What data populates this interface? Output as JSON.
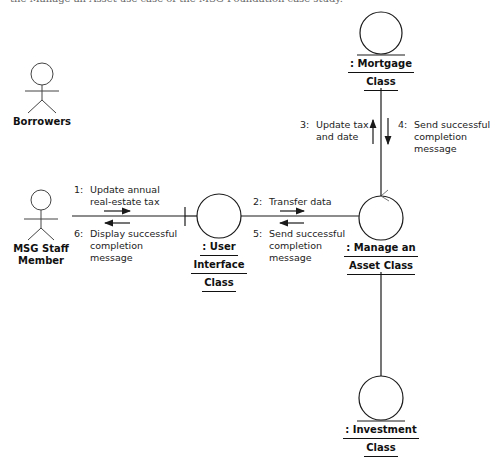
{
  "caption": "the Manage an Asset use case of the MSG Foundation case study.",
  "actors": [
    {
      "id": "borrowers",
      "label": "Borrowers"
    },
    {
      "id": "msg-staff",
      "label_line1": "MSG Staff",
      "label_line2": "Member"
    }
  ],
  "objects": {
    "mortgage": {
      "line1": ": Mortgage",
      "line2": "Class",
      "type": "entity"
    },
    "user_interface": {
      "line1": ": User",
      "line2": "Interface",
      "line3": "Class",
      "type": "boundary"
    },
    "manage_asset": {
      "line1": ": Manage an",
      "line2": "Asset Class",
      "type": "control"
    },
    "investment": {
      "line1": ": Investment",
      "line2": "Class",
      "type": "entity"
    }
  },
  "messages": [
    {
      "num": "1:",
      "line1": "Update annual",
      "line2": "real-estate tax",
      "direction": "right"
    },
    {
      "num": "2:",
      "line1": "Transfer data",
      "direction": "right"
    },
    {
      "num": "3:",
      "line1": "Update tax",
      "line2": "and date",
      "direction": "up"
    },
    {
      "num": "4:",
      "line1": "Send successful",
      "line2": "completion",
      "line3": "message",
      "direction": "down"
    },
    {
      "num": "5:",
      "line1": "Send successful",
      "line2": "completion",
      "line3": "message",
      "direction": "left"
    },
    {
      "num": "6:",
      "line1": "Display successful",
      "line2": "completion",
      "line3": "message",
      "direction": "left"
    }
  ],
  "colors": {
    "stroke": "#1a1a1a",
    "background": "#ffffff"
  }
}
